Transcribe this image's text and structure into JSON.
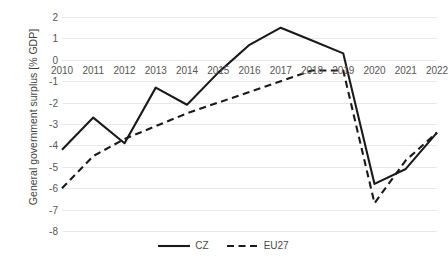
{
  "chart_data": {
    "type": "line",
    "title": "",
    "xlabel": "",
    "ylabel": "General government surplus [% GDP]",
    "x": [
      2010,
      2011,
      2012,
      2013,
      2014,
      2015,
      2016,
      2017,
      2018,
      2019,
      2020,
      2021,
      2022
    ],
    "xtick_labels": [
      "2010",
      "2011",
      "2012",
      "2013",
      "2014",
      "2015",
      "2016",
      "2017",
      "2018",
      "2019",
      "2020",
      "2021",
      "2022"
    ],
    "ytick_labels": [
      "2",
      "1",
      "0",
      "-1",
      "-2",
      "-3",
      "-4",
      "-5",
      "-6",
      "-7",
      "-8"
    ],
    "yticks": [
      2,
      1,
      0,
      -1,
      -2,
      -3,
      -4,
      -5,
      -6,
      -7,
      -8
    ],
    "ylim": [
      -8,
      2
    ],
    "xlim": [
      2010,
      2022
    ],
    "grid": true,
    "legend_position": "bottom",
    "series": [
      {
        "name": "CZ",
        "style": "solid",
        "color": "#1a1a1a",
        "values": [
          -4.2,
          -2.7,
          -3.9,
          -1.3,
          -2.1,
          -0.6,
          0.7,
          1.5,
          0.9,
          0.3,
          -5.8,
          -5.1,
          -3.4
        ]
      },
      {
        "name": "EU27",
        "style": "dashed",
        "color": "#1a1a1a",
        "values": [
          -6.0,
          -4.5,
          -3.7,
          -3.1,
          -2.5,
          -2.0,
          -1.5,
          -1.0,
          -0.5,
          -0.5,
          -6.7,
          -4.7,
          -3.4
        ]
      }
    ]
  },
  "legend": {
    "items": [
      {
        "label": "CZ",
        "style": "solid"
      },
      {
        "label": "EU27",
        "style": "dashed"
      }
    ]
  }
}
